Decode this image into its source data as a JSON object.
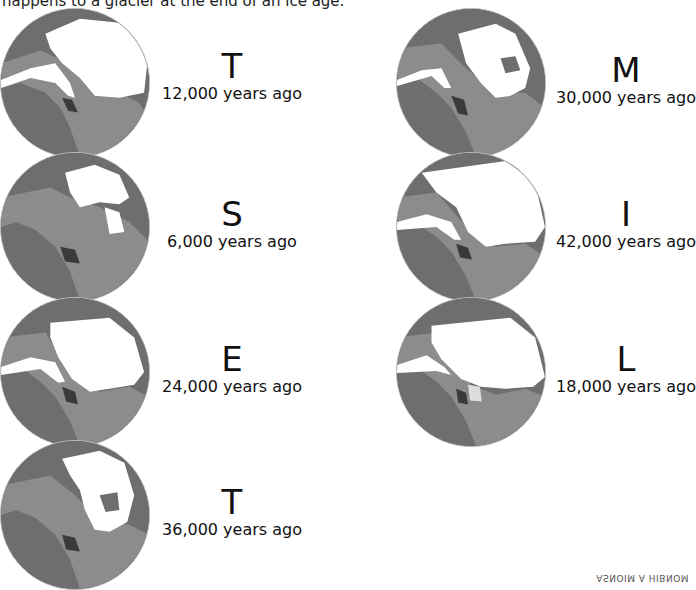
{
  "header": {
    "text": "happens to a glacier at the end of an ice age."
  },
  "panels": [
    {
      "letter": "T",
      "caption": "12,000 years ago",
      "ice": "medium"
    },
    {
      "letter": "M",
      "caption": "30,000 years ago",
      "ice": "medium-small"
    },
    {
      "letter": "S",
      "caption": "6,000 years ago",
      "ice": "small"
    },
    {
      "letter": "I",
      "caption": "42,000 years ago",
      "ice": "large"
    },
    {
      "letter": "E",
      "caption": "24,000 years ago",
      "ice": "large"
    },
    {
      "letter": "L",
      "caption": "18,000 years ago",
      "ice": "largest"
    },
    {
      "letter": "T",
      "caption": "36,000 years ago",
      "ice": "small-medium"
    }
  ],
  "footer": {
    "text": "ASNOIM A HIBNOM"
  },
  "colors": {
    "ocean": "#6e6e6e",
    "land": "#8c8c8c",
    "ice": "#ffffff",
    "mountains": "#3a3a3a"
  }
}
